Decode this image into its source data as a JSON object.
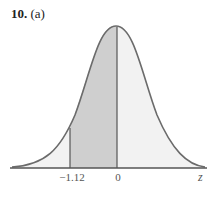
{
  "problem": {
    "number": "10.",
    "part": "(a)"
  },
  "figure": {
    "type": "standard normal curve with shaded area",
    "shaded_from": -1.12,
    "shaded_to": 0,
    "axis_label": "z",
    "tick_labels": [
      "−1.12",
      "0"
    ],
    "colors": {
      "shaded": "#cfcfcf",
      "unshaded": "#f2f2f2",
      "curve": "#6b6b6b",
      "axis": "#555555"
    }
  }
}
